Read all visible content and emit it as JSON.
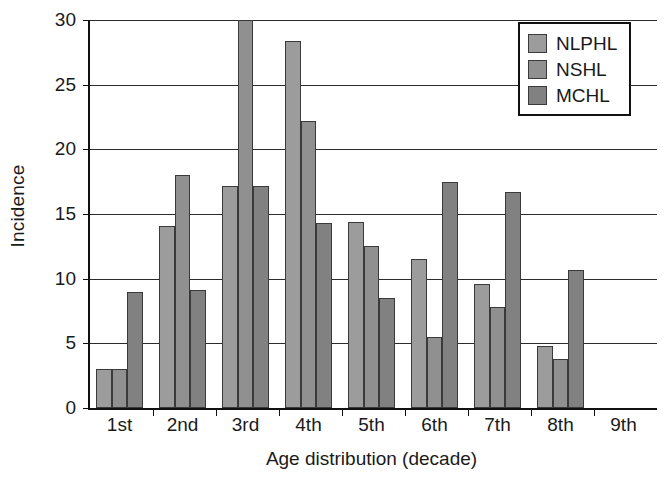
{
  "chart_data": {
    "type": "bar",
    "title": "",
    "xlabel": "Age distribution (decade)",
    "ylabel": "Incidence",
    "categories": [
      "1st",
      "2nd",
      "3rd",
      "4th",
      "5th",
      "6th",
      "7th",
      "8th",
      "9th"
    ],
    "series": [
      {
        "name": "NLPHL",
        "color": "#9c9c9c",
        "values": [
          3.0,
          14.1,
          17.2,
          28.4,
          14.4,
          11.5,
          9.6,
          4.8,
          0
        ]
      },
      {
        "name": "NSHL",
        "color": "#909090",
        "values": [
          3.0,
          18.0,
          30.0,
          22.2,
          12.5,
          5.5,
          7.8,
          3.8,
          0
        ]
      },
      {
        "name": "MCHL",
        "color": "#818181",
        "values": [
          9.0,
          9.1,
          17.2,
          14.3,
          8.5,
          17.5,
          16.7,
          10.7,
          0
        ]
      }
    ],
    "ylim": [
      0,
      30
    ],
    "yticks": [
      0,
      5,
      10,
      15,
      20,
      25,
      30
    ],
    "ytick_labels": [
      "0",
      "5",
      "10",
      "15",
      "20",
      "25",
      "30"
    ],
    "grid": true,
    "legend_position": "top-right",
    "axis_color": "#111111",
    "grid_color": "#2b2b2b",
    "background": "#ffffff"
  }
}
